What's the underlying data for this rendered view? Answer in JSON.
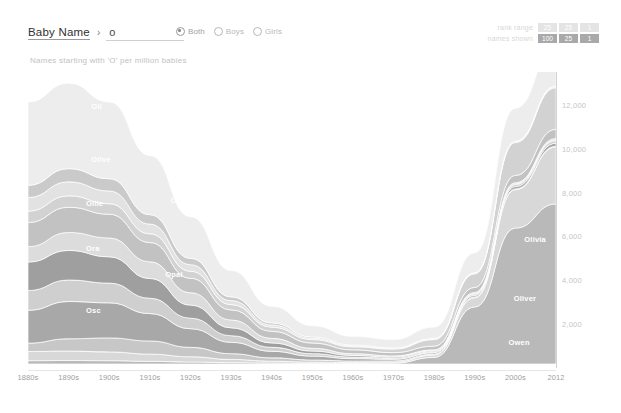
{
  "header": {
    "breadcrumb_label": "Baby Name",
    "breadcrumb_caret": "›",
    "search_value": "o",
    "search_placeholder": "",
    "gender_options": [
      {
        "label": "Both",
        "selected": true
      },
      {
        "label": "Boys",
        "selected": false
      },
      {
        "label": "Girls",
        "selected": false
      }
    ],
    "segments": [
      {
        "caption": "rank range",
        "cells": [
          {
            "label": "25",
            "state": "light"
          },
          {
            "label": "25",
            "state": "light"
          },
          {
            "label": "1",
            "state": "light"
          }
        ]
      },
      {
        "caption": "names shown",
        "cells": [
          {
            "label": "100",
            "state": "active"
          },
          {
            "label": "25",
            "state": "active"
          },
          {
            "label": "1",
            "state": "active"
          }
        ]
      }
    ],
    "subtitle": "Names starting with 'O' per million babies"
  },
  "chart_data": {
    "type": "area",
    "title": "Names starting with 'O' per million babies",
    "xlabel": "",
    "ylabel": "per million babies",
    "ylim": [
      0,
      13500
    ],
    "yticks": [
      2000,
      4000,
      6000,
      8000,
      10000,
      12000
    ],
    "ytick_labels": [
      "2,000",
      "4,000",
      "6,000",
      "8,000",
      "10,000",
      "12,000"
    ],
    "grid": false,
    "legend_position": "inline-labels",
    "x": [
      "1880s",
      "1890s",
      "1900s",
      "1910s",
      "1920s",
      "1930s",
      "1940s",
      "1950s",
      "1960s",
      "1970s",
      "1980s",
      "1990s",
      "2000s",
      "2012"
    ],
    "series": [
      {
        "name": "Olivia",
        "color": "#b9b9b9",
        "values": [
          150,
          160,
          150,
          120,
          90,
          60,
          40,
          30,
          25,
          40,
          300,
          2600,
          6200,
          7300
        ]
      },
      {
        "name": "Oliver",
        "color": "#d8d8d8",
        "values": [
          420,
          430,
          400,
          330,
          240,
          150,
          90,
          55,
          40,
          45,
          110,
          420,
          1750,
          2600
        ]
      },
      {
        "name": "Olga",
        "color": "#c7c7c7",
        "values": [
          380,
          560,
          640,
          600,
          430,
          260,
          150,
          95,
          70,
          55,
          45,
          40,
          35,
          30
        ]
      },
      {
        "name": "Ollie",
        "color": "#a8a8a8",
        "values": [
          1500,
          1700,
          1600,
          1250,
          850,
          520,
          300,
          180,
          110,
          75,
          60,
          70,
          110,
          140
        ]
      },
      {
        "name": "Otto",
        "color": "#cfcfcf",
        "values": [
          900,
          980,
          900,
          700,
          480,
          300,
          180,
          110,
          70,
          50,
          45,
          55,
          90,
          120
        ]
      },
      {
        "name": "Ora",
        "color": "#9f9f9f",
        "values": [
          1300,
          1350,
          1200,
          900,
          600,
          360,
          200,
          120,
          75,
          50,
          40,
          35,
          30,
          28
        ]
      },
      {
        "name": "Opal",
        "color": "#dcdcdc",
        "values": [
          700,
          820,
          860,
          760,
          560,
          360,
          210,
          125,
          80,
          55,
          45,
          45,
          55,
          65
        ]
      },
      {
        "name": "Oscar",
        "color": "#c2c2c2",
        "values": [
          1100,
          1150,
          1080,
          880,
          660,
          460,
          320,
          240,
          175,
          150,
          170,
          230,
          330,
          420
        ]
      },
      {
        "name": "Owen",
        "color": "#d2d2d2",
        "values": [
          520,
          520,
          480,
          400,
          320,
          240,
          190,
          160,
          140,
          160,
          300,
          620,
          1500,
          1900
        ]
      },
      {
        "name": "Ottilie",
        "color": "#e2e2e2",
        "values": [
          620,
          640,
          580,
          440,
          300,
          180,
          100,
          60,
          40,
          30,
          28,
          30,
          40,
          48
        ]
      },
      {
        "name": "Orville",
        "color": "#cacaca",
        "values": [
          560,
          600,
          560,
          430,
          290,
          170,
          95,
          55,
          35,
          25,
          22,
          22,
          25,
          28
        ]
      },
      {
        "name": "Others",
        "color": "#ededed",
        "values": [
          3800,
          3900,
          3500,
          2700,
          1900,
          1200,
          760,
          520,
          400,
          380,
          520,
          900,
          1500,
          1850
        ]
      }
    ],
    "inline_labels": [
      {
        "text": "Oli",
        "x_pct": 12,
        "y_pct": 10
      },
      {
        "text": "Olive",
        "x_pct": 12,
        "y_pct": 28
      },
      {
        "text": "Ollie",
        "x_pct": 11,
        "y_pct": 43
      },
      {
        "text": "Olga",
        "x_pct": 27,
        "y_pct": 42
      },
      {
        "text": "Ora",
        "x_pct": 11,
        "y_pct": 58
      },
      {
        "text": "Opal",
        "x_pct": 26,
        "y_pct": 67
      },
      {
        "text": "Osc",
        "x_pct": 11,
        "y_pct": 79
      },
      {
        "text": "Olivia",
        "x_pct": 94,
        "y_pct": 55
      },
      {
        "text": "Oliver",
        "x_pct": 92,
        "y_pct": 75
      },
      {
        "text": "Owen",
        "x_pct": 91,
        "y_pct": 90
      }
    ]
  }
}
